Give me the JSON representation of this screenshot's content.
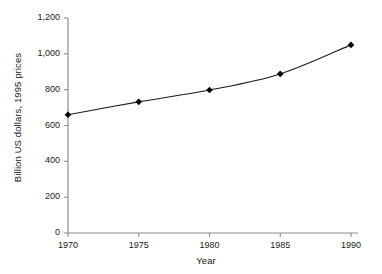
{
  "chart_data": {
    "type": "line",
    "title": "",
    "xlabel": "Year",
    "ylabel": "Billion US dollars, 1995 prices",
    "x": [
      1970,
      1975,
      1980,
      1985,
      1990
    ],
    "values": [
      660,
      732,
      798,
      888,
      1050
    ],
    "series": [
      {
        "name": "",
        "values": [
          660,
          732,
          798,
          888,
          1050
        ]
      }
    ],
    "xtick_labels": [
      "1970",
      "1975",
      "1980",
      "1985",
      "1990"
    ],
    "ytick_labels": [
      "0",
      "200",
      "400",
      "600",
      "800",
      "1,000",
      "1,200"
    ],
    "yticks": [
      0,
      200,
      400,
      600,
      800,
      1000,
      1200
    ],
    "xlim": [
      1970,
      1990
    ],
    "ylim": [
      0,
      1200
    ],
    "grid": false,
    "legend": "none",
    "marker": "diamond",
    "line_color": "#1a1a1a",
    "marker_color": "#000000",
    "axis_color": "#808080",
    "background_color": "#ffffff"
  }
}
